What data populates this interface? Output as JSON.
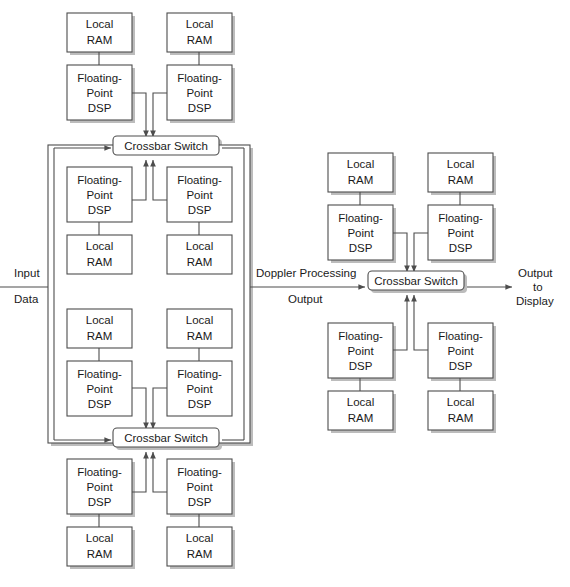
{
  "diagram": {
    "title": "",
    "colors": {
      "stroke": "#4d4d4d",
      "shadow": "#b9b9b9",
      "text": "#1a1a1a",
      "fill": "#ffffff",
      "background": "#ffffff"
    },
    "labels": {
      "local_ram": "Local\nRAM",
      "local_ram_line1": "Local",
      "local_ram_line2": "RAM",
      "fp_dsp_line1": "Floating-",
      "fp_dsp_line2": "Point",
      "fp_dsp_line3": "DSP",
      "crossbar": "Crossbar Switch"
    },
    "io": {
      "input_line1": "Input",
      "input_line2": "Data",
      "middle_line1": "Doppler Processing",
      "middle_line2": "Output",
      "output_line1": "Output",
      "output_line2": "to",
      "output_line3": "Display"
    },
    "clusters": [
      {
        "name": "left-cluster",
        "crossbars": [
          "Crossbar Switch",
          "Crossbar Switch"
        ],
        "node_count": 8,
        "ram_count": 8,
        "dsp_count": 8
      },
      {
        "name": "right-cluster",
        "crossbars": [
          "Crossbar Switch"
        ],
        "node_count": 4,
        "ram_count": 4,
        "dsp_count": 4
      }
    ],
    "nodes": [
      {
        "id": "L-T1",
        "ram": "Local RAM",
        "dsp": "Floating-Point DSP",
        "position": "top-above-left"
      },
      {
        "id": "L-T2",
        "ram": "Local RAM",
        "dsp": "Floating-Point DSP",
        "position": "top-above-right"
      },
      {
        "id": "L-T3",
        "ram": "Local RAM",
        "dsp": "Floating-Point DSP",
        "position": "top-below-left"
      },
      {
        "id": "L-T4",
        "ram": "Local RAM",
        "dsp": "Floating-Point DSP",
        "position": "top-below-right"
      },
      {
        "id": "L-B1",
        "ram": "Local RAM",
        "dsp": "Floating-Point DSP",
        "position": "bottom-above-left"
      },
      {
        "id": "L-B2",
        "ram": "Local RAM",
        "dsp": "Floating-Point DSP",
        "position": "bottom-above-right"
      },
      {
        "id": "L-B3",
        "ram": "Local RAM",
        "dsp": "Floating-Point DSP",
        "position": "bottom-below-left"
      },
      {
        "id": "L-B4",
        "ram": "Local RAM",
        "dsp": "Floating-Point DSP",
        "position": "bottom-below-right"
      },
      {
        "id": "R-1",
        "ram": "Local RAM",
        "dsp": "Floating-Point DSP",
        "position": "right-above-left"
      },
      {
        "id": "R-2",
        "ram": "Local RAM",
        "dsp": "Floating-Point DSP",
        "position": "right-above-right"
      },
      {
        "id": "R-3",
        "ram": "Local RAM",
        "dsp": "Floating-Point DSP",
        "position": "right-below-left"
      },
      {
        "id": "R-4",
        "ram": "Local RAM",
        "dsp": "Floating-Point DSP",
        "position": "right-below-right"
      }
    ]
  }
}
